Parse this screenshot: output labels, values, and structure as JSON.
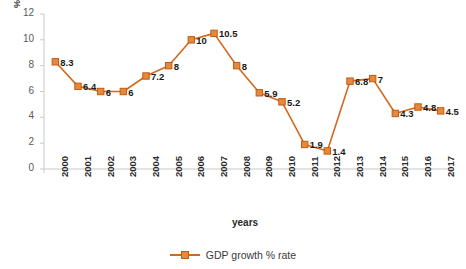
{
  "chart_data": {
    "type": "line",
    "title": "",
    "xlabel": "years",
    "ylabel": "%",
    "ylim": [
      0,
      12
    ],
    "yticks": [
      0,
      2,
      4,
      6,
      8,
      10,
      12
    ],
    "grid": false,
    "legend_position": "bottom",
    "categories": [
      "2000",
      "2001",
      "2002",
      "2003",
      "2004",
      "2005",
      "2006",
      "2007",
      "2008",
      "2009",
      "2010",
      "2011",
      "2012",
      "2013",
      "2014",
      "2015",
      "2016",
      "2017"
    ],
    "series": [
      {
        "name": "GDP growth % rate",
        "color": "#D2691E",
        "marker_color": "#E38A3E",
        "values": [
          8.3,
          6.4,
          6,
          6,
          7.2,
          8,
          10,
          10.5,
          8,
          5.9,
          5.2,
          1.9,
          1.4,
          6.8,
          7,
          4.3,
          4.8,
          4.5
        ],
        "data_labels": [
          "8.3",
          "6.4",
          "6",
          "6",
          "7.2",
          "8",
          "10",
          "10.5",
          "8",
          "5.9",
          "5.2",
          "1.9",
          "1.4",
          "6.8",
          "7",
          "4.3",
          "4.8",
          "4.5"
        ]
      }
    ]
  },
  "legend": {
    "entries": [
      {
        "label": "GDP growth % rate"
      }
    ]
  }
}
